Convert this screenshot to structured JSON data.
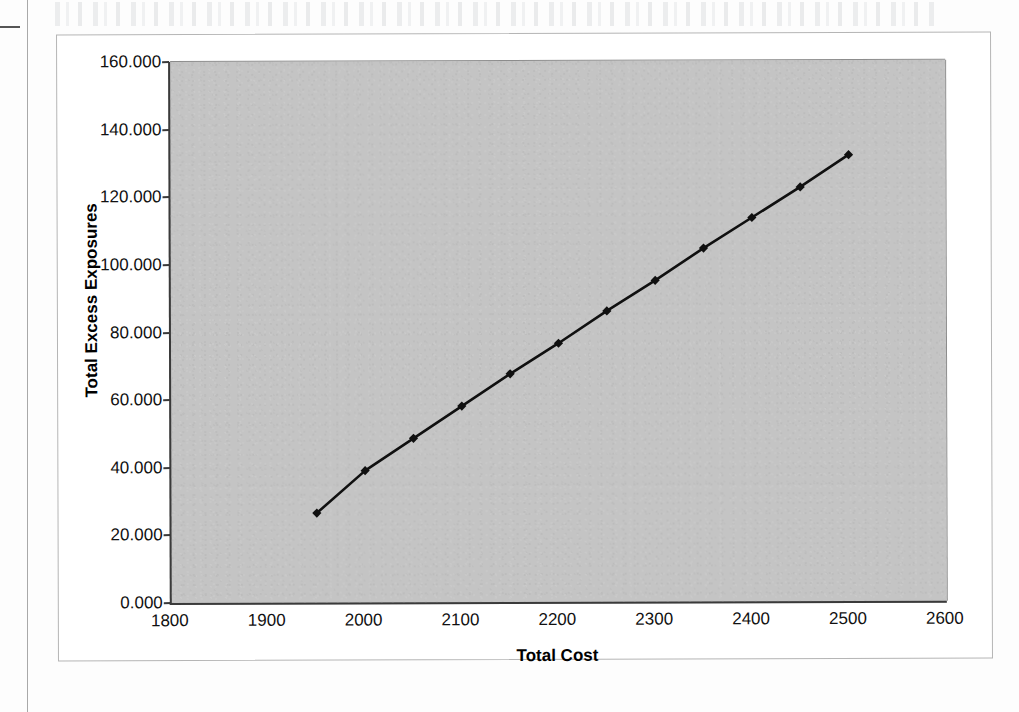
{
  "figure": {
    "background_color": "#ffffff",
    "frame_color": "#b5b5b5",
    "plot_background_color": "#c4c4c4",
    "series_color": "#101010"
  },
  "axes": {
    "y_title": "Total Excess Exposures",
    "x_title": "Total Cost",
    "y_ticks": [
      "0.000",
      "20.000",
      "40.000",
      "60.000",
      "80.000",
      "100.000",
      "120.000",
      "140.000",
      "160.000"
    ],
    "x_ticks": [
      "1800",
      "1900",
      "2000",
      "2100",
      "2200",
      "2300",
      "2400",
      "2500",
      "2600"
    ]
  },
  "chart_data": {
    "type": "line",
    "title": "",
    "subtitle": "",
    "xlabel": "Total Cost",
    "ylabel": "Total Excess Exposures",
    "xlim": [
      1800,
      2600
    ],
    "ylim": [
      0,
      160
    ],
    "xticks": [
      1800,
      1900,
      2000,
      2100,
      2200,
      2300,
      2400,
      2500,
      2600
    ],
    "yticks": [
      0,
      20,
      40,
      60,
      80,
      100,
      120,
      140,
      160
    ],
    "ytick_labels": [
      "0.000",
      "20.000",
      "40.000",
      "60.000",
      "80.000",
      "100.000",
      "120.000",
      "140.000",
      "160.000"
    ],
    "grid": false,
    "legend": false,
    "marker": "diamond",
    "line_color": "#101010",
    "x": [
      1950,
      2000,
      2050,
      2100,
      2150,
      2200,
      2250,
      2300,
      2350,
      2400,
      2450,
      2500
    ],
    "y": [
      26.5,
      39.0,
      48.5,
      58.0,
      67.5,
      76.5,
      86.0,
      95.0,
      104.5,
      113.5,
      122.5,
      132.0
    ],
    "series": [
      {
        "name": "Total Excess Exposures",
        "x": [
          1950,
          2000,
          2050,
          2100,
          2150,
          2200,
          2250,
          2300,
          2350,
          2400,
          2450,
          2500
        ],
        "values": [
          26.5,
          39.0,
          48.5,
          58.0,
          67.5,
          76.5,
          86.0,
          95.0,
          104.5,
          113.5,
          122.5,
          132.0
        ]
      }
    ]
  }
}
